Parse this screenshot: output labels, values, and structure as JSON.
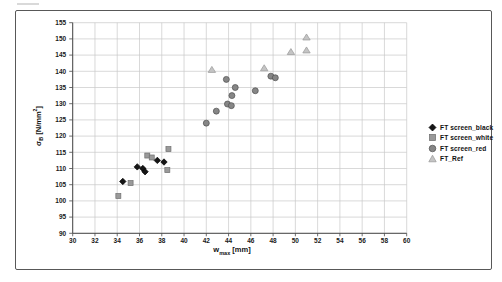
{
  "colors": {
    "background": "#ffffff",
    "frame_border": "#585858",
    "grid": "#c9c9c9",
    "axis": "#4a4a4a",
    "tick_text": "#191919"
  },
  "chart_data": {
    "type": "scatter",
    "title": "",
    "xlabel": {
      "base": "w",
      "sub": "max",
      "rest": " [mm]"
    },
    "ylabel": {
      "base": "σ",
      "sub": "B",
      "rest": " [N/mm",
      "sup": "2",
      "end": "]"
    },
    "x_axis": {
      "min": 30,
      "max": 60,
      "step": 2,
      "ticks": [
        30,
        32,
        34,
        36,
        38,
        40,
        42,
        44,
        46,
        48,
        50,
        52,
        54,
        56,
        58,
        60
      ]
    },
    "y_axis": {
      "min": 90,
      "max": 155,
      "step": 5,
      "ticks": [
        90,
        95,
        100,
        105,
        110,
        115,
        120,
        125,
        130,
        135,
        140,
        145,
        150,
        155
      ]
    },
    "grid": true,
    "legend_position": "right-middle",
    "series": [
      {
        "name": "FT screen_black",
        "marker": "diamond",
        "color": "#161616",
        "stroke": "#000000",
        "points": [
          [
            34.5,
            106
          ],
          [
            35.8,
            110.5
          ],
          [
            36.3,
            110
          ],
          [
            36.5,
            109
          ],
          [
            37.6,
            112.5
          ],
          [
            38.2,
            112
          ]
        ]
      },
      {
        "name": "FT screen_white",
        "marker": "square",
        "color": "#9a9a9a",
        "stroke": "#6f6f6f",
        "points": [
          [
            34.1,
            101.5
          ],
          [
            35.2,
            105.5
          ],
          [
            36.7,
            114
          ],
          [
            37.1,
            113.4
          ],
          [
            38.5,
            109.5
          ],
          [
            38.6,
            116
          ]
        ]
      },
      {
        "name": "FT screen_red",
        "marker": "circle",
        "color": "#868686",
        "stroke": "#4f4f4f",
        "points": [
          [
            42.0,
            124
          ],
          [
            42.9,
            127.7
          ],
          [
            43.8,
            137.5
          ],
          [
            43.9,
            129.9
          ],
          [
            44.25,
            129.4
          ],
          [
            44.3,
            132.5
          ],
          [
            44.6,
            135
          ],
          [
            46.4,
            134
          ],
          [
            47.8,
            138.5
          ],
          [
            48.2,
            138
          ]
        ]
      },
      {
        "name": "FT_Ref",
        "marker": "triangle",
        "color": "#c4c4c4",
        "stroke": "#979797",
        "points": [
          [
            42.5,
            140.5
          ],
          [
            47.2,
            141
          ],
          [
            49.6,
            146
          ],
          [
            51.0,
            146.5
          ],
          [
            51.0,
            150.5
          ]
        ]
      }
    ]
  }
}
